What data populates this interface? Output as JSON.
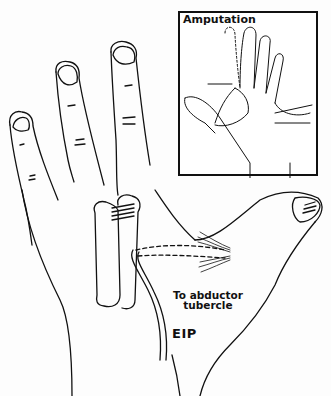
{
  "figure": {
    "inset": {
      "title": "Amputation"
    },
    "labels": {
      "abductor_line1": "To abductor",
      "abductor_line2": "tubercle",
      "tendon": "EIP"
    },
    "colors": {
      "ink": "#111111",
      "paper": "#fdfdfd"
    }
  }
}
